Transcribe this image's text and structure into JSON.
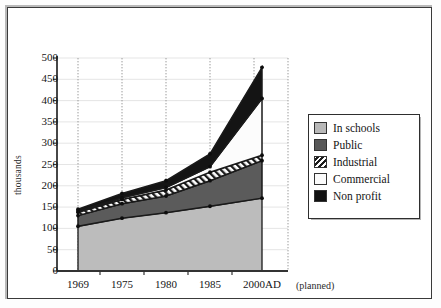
{
  "chart_data": {
    "type": "area",
    "title": "",
    "subtitle": "",
    "xlabel": "",
    "ylabel": "thousands",
    "categories": [
      "1969",
      "1975",
      "1980",
      "1985",
      "2000AD"
    ],
    "x_annotation": "(planned)",
    "ylim": [
      0,
      500
    ],
    "ytick_step": 50,
    "yticks": [
      "0",
      "50",
      "100",
      "150",
      "200",
      "250",
      "300",
      "350",
      "400",
      "450",
      "500"
    ],
    "grid": "both-light-vertical-dotted",
    "legend_position": "right",
    "stacked": true,
    "series": [
      {
        "name": "In schools",
        "color": "#b8b8b8",
        "pattern": "solid",
        "values": [
          105,
          124,
          137,
          152,
          171
        ]
      },
      {
        "name": "Public",
        "color": "#585858",
        "pattern": "solid",
        "values": [
          25,
          34,
          39,
          60,
          88
        ]
      },
      {
        "name": "Industrial",
        "color": "#1c1c1c",
        "pattern": "diagonal-hatch",
        "values": [
          8,
          10,
          14,
          20,
          13
        ]
      },
      {
        "name": "Commercial",
        "color": "#fbfbfb",
        "pattern": "solid",
        "values": [
          3,
          4,
          6,
          13,
          133
        ]
      },
      {
        "name": "Non profit",
        "color": "#111111",
        "pattern": "solid",
        "values": [
          4,
          10,
          16,
          30,
          73
        ]
      }
    ],
    "cumulative_tops": [
      {
        "name": "In schools",
        "values": [
          105,
          124,
          137,
          152,
          171
        ]
      },
      {
        "name": "Public",
        "values": [
          130,
          158,
          176,
          212,
          259
        ]
      },
      {
        "name": "Industrial",
        "values": [
          138,
          168,
          190,
          232,
          272
        ]
      },
      {
        "name": "Commercial",
        "values": [
          141,
          172,
          196,
          245,
          405
        ]
      },
      {
        "name": "Non profit",
        "values": [
          145,
          182,
          212,
          275,
          478
        ]
      }
    ]
  },
  "legend": {
    "items": [
      {
        "label": "In schools"
      },
      {
        "label": "Public"
      },
      {
        "label": "Industrial"
      },
      {
        "label": "Commercial"
      },
      {
        "label": "Non profit"
      }
    ]
  }
}
